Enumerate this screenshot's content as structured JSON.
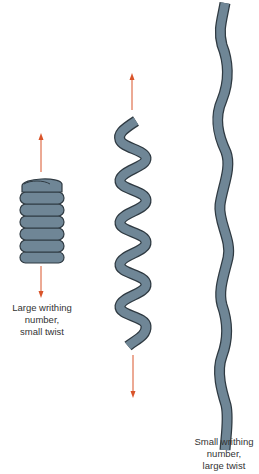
{
  "figure": {
    "colors": {
      "tube_fill": "#6f8696",
      "tube_stroke": "#2f3a42",
      "arrow": "#d9542a",
      "text": "#333333"
    },
    "panels": [
      {
        "id": "coil",
        "description": "tightly coiled supercoil (solenoid-like)",
        "label_lines": [
          "Large writhing",
          "number,",
          "small twist"
        ],
        "arrows": [
          "up",
          "down"
        ]
      },
      {
        "id": "helix",
        "description": "stretched helical supercoil",
        "label_lines": [],
        "arrows": [
          "up",
          "down"
        ]
      },
      {
        "id": "wavy",
        "description": "nearly straight wavy tube",
        "label_lines": [
          "Small writhing",
          "number,",
          "large twist"
        ],
        "arrows": []
      }
    ]
  }
}
